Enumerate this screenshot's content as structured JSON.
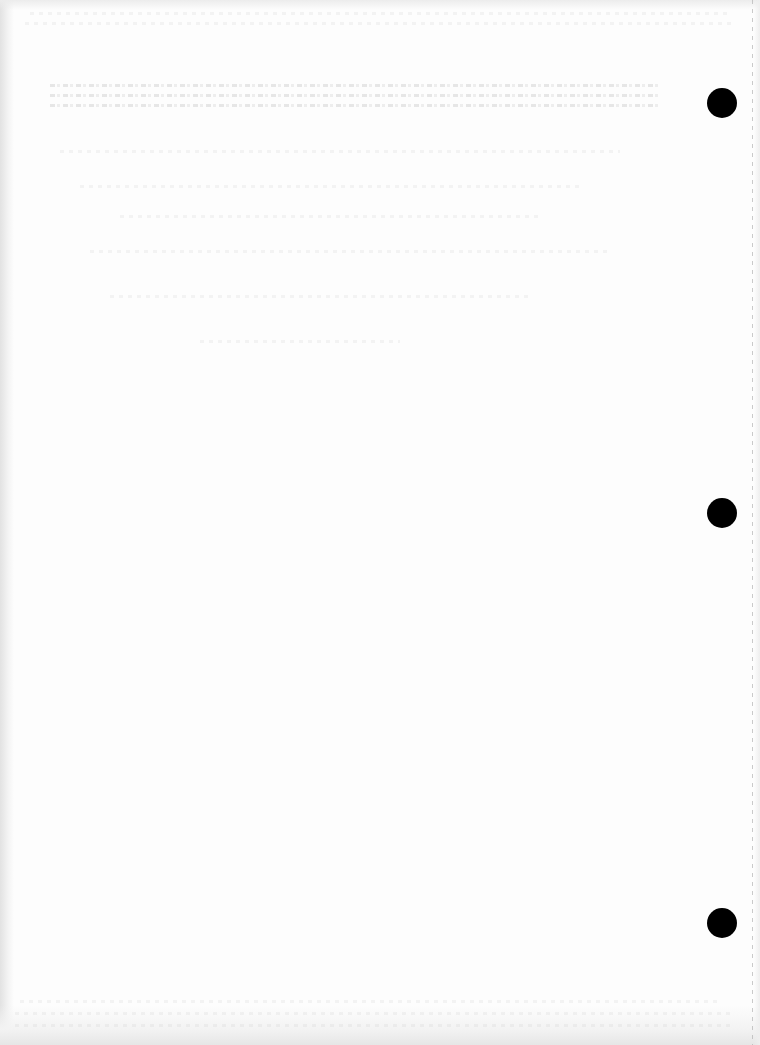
{
  "document": {
    "type": "scanned blank page",
    "legible_text": []
  },
  "punch_holes": [
    {
      "x": 722,
      "y": 103
    },
    {
      "x": 722,
      "y": 513
    },
    {
      "x": 722,
      "y": 923
    }
  ],
  "colors": {
    "paper": "#fdfdfd",
    "punch_hole": "#000000",
    "edge_shadow": "#e2e2e2"
  }
}
